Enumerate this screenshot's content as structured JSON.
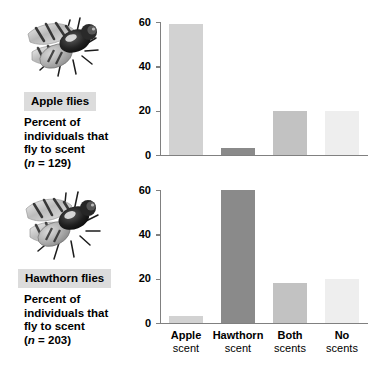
{
  "figure": {
    "axis_color": "#808080",
    "label_box_bg": "#dcdcdc"
  },
  "panels": [
    {
      "id": "apple-flies",
      "species_label": "Apple flies",
      "caption_line1": "Percent of",
      "caption_line2": "individuals that",
      "caption_line3": "fly to scent",
      "caption_n_prefix": "(",
      "caption_n_italic": "n",
      "caption_n_suffix": " = 129)",
      "photo_alt": "apple-maggot-fly-photo"
    },
    {
      "id": "hawthorn-flies",
      "species_label": "Hawthorn flies",
      "caption_line1": "Percent of",
      "caption_line2": "individuals that",
      "caption_line3": "fly to scent",
      "caption_n_prefix": "(",
      "caption_n_italic": "n",
      "caption_n_suffix": " = 203)",
      "photo_alt": "hawthorn-fly-photo"
    }
  ],
  "chart_data": [
    {
      "type": "bar",
      "title": "Apple flies",
      "xlabel": "",
      "ylabel": "Percent of individuals that fly to scent",
      "categories": [
        "Apple scent",
        "Hawthorn scent",
        "Both scents",
        "No scents"
      ],
      "category_lines": [
        {
          "line1": "Apple",
          "line2": "scent"
        },
        {
          "line1": "Hawthorn",
          "line2": "scent"
        },
        {
          "line1": "Both",
          "line2": "scents"
        },
        {
          "line1": "No",
          "line2": "scents"
        }
      ],
      "values": [
        59,
        3,
        20,
        20
      ],
      "colors": [
        "#d2d2d2",
        "#8a8a8a",
        "#c2c2c2",
        "#eeeeee"
      ],
      "ylim": [
        0,
        60
      ],
      "yticks": [
        0,
        20,
        40,
        60
      ],
      "ytick_labels": [
        "0",
        "20",
        "40",
        "60"
      ],
      "grid": false,
      "legend": "none",
      "n": 129
    },
    {
      "type": "bar",
      "title": "Hawthorn flies",
      "xlabel": "",
      "ylabel": "Percent of individuals that fly to scent",
      "categories": [
        "Apple scent",
        "Hawthorn scent",
        "Both scents",
        "No scents"
      ],
      "category_lines": [
        {
          "line1": "Apple",
          "line2": "scent"
        },
        {
          "line1": "Hawthorn",
          "line2": "scent"
        },
        {
          "line1": "Both",
          "line2": "scents"
        },
        {
          "line1": "No",
          "line2": "scents"
        }
      ],
      "values": [
        3,
        60,
        18,
        20
      ],
      "colors": [
        "#d2d2d2",
        "#8a8a8a",
        "#c2c2c2",
        "#eeeeee"
      ],
      "ylim": [
        0,
        60
      ],
      "yticks": [
        0,
        20,
        40,
        60
      ],
      "ytick_labels": [
        "0",
        "20",
        "40",
        "60"
      ],
      "grid": false,
      "legend": "none",
      "n": 203
    }
  ]
}
